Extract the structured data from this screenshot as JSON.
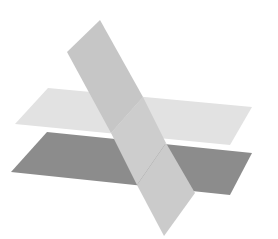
{
  "diagram": {
    "colors": {
      "background": "#ffffff",
      "upper_plane": "#e2e2e2",
      "lower_plane": "#8a8a8a",
      "oblique_plane": "#c4c4c4",
      "oblique_between": "#d0d0d0",
      "oblique_below": "#cfcfcf"
    },
    "planes": [
      {
        "name": "upper-horizontal-plane",
        "points": "48,88 15,124 230,145 252,107"
      },
      {
        "name": "lower-horizontal-plane",
        "points": "47,132 11,172 230,195 252,153"
      },
      {
        "name": "oblique-plane-top",
        "points": "100,20 67,52 111,133 143,97"
      },
      {
        "name": "oblique-plane-middle",
        "points": "111,133 137,185 166,143 143,97"
      },
      {
        "name": "oblique-plane-bottom",
        "points": "137,185 164,236 195,193 166,143"
      }
    ]
  }
}
